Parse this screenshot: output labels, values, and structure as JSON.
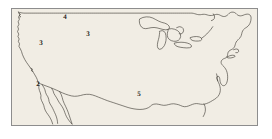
{
  "figure": {
    "kind": "outline-map",
    "background_color": "#ffffff",
    "map_fill_color": "#f1ede4",
    "coastline_color": "#3a3630",
    "border_color": "#8d8d8d",
    "label_color": "#1d1a16"
  },
  "frame": {
    "name": "map-border-box",
    "x": 11,
    "y": 8,
    "width": 247,
    "height": 118
  },
  "labels": [
    {
      "id": "label-4-north-central",
      "text": "4",
      "x": 65,
      "y": 17,
      "region_hint": "north-central"
    },
    {
      "id": "label-3-west",
      "text": "3",
      "x": 41,
      "y": 43,
      "region_hint": "west"
    },
    {
      "id": "label-3-central",
      "text": "3",
      "x": 88,
      "y": 34,
      "region_hint": "central"
    },
    {
      "id": "label-2-southern-california-coast",
      "text": "2",
      "x": 38,
      "y": 84,
      "region_hint": "southern-california-coast"
    },
    {
      "id": "label-5-gulf-texas",
      "text": "5",
      "x": 139,
      "y": 94,
      "region_hint": "gulf-texas"
    }
  ],
  "features": {
    "mainland_outline": "United States contiguous landmass outline",
    "great_lakes": [
      "Lake Superior",
      "Lake Michigan",
      "Lake Huron",
      "Lake Erie",
      "Lake Ontario"
    ],
    "peninsulas": [
      "Florida",
      "Baja California",
      "Cape Cod",
      "Delmarva"
    ],
    "water_bodies": [
      "Gulf of California",
      "Gulf of Mexico",
      "Chesapeake Bay",
      "Puget Sound"
    ]
  }
}
